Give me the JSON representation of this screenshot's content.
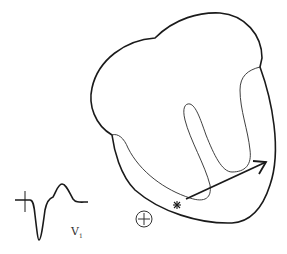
{
  "diagram": {
    "lead_label": "V",
    "lead_subscript": "1",
    "electrode_symbol": "positive-electrode",
    "origin_marker": "asterisk",
    "vector": "depolarization-arrow",
    "colors": {
      "stroke": "#1a1a1a",
      "background": "#ffffff"
    }
  }
}
